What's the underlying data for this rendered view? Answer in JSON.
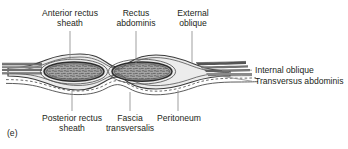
{
  "figure": {
    "panel_id": "(e)",
    "type": "anatomical-cross-section",
    "background": "#ffffff",
    "ink": "#231f20"
  },
  "labels": {
    "top": [
      {
        "id": "anterior-rectus-sheath",
        "line1": "Anterior rectus",
        "line2": "sheath"
      },
      {
        "id": "rectus-abdominis",
        "line1": "Rectus",
        "line2": "abdominis"
      },
      {
        "id": "external-oblique",
        "line1": "External",
        "line2": "oblique"
      }
    ],
    "right": [
      {
        "id": "internal-oblique",
        "line1": "Internal oblique"
      },
      {
        "id": "transversus-abdominis",
        "line1": "Transversus abdominis"
      }
    ],
    "bottom": [
      {
        "id": "posterior-rectus-sheath",
        "line1": "Posterior rectus",
        "line2": "sheath"
      },
      {
        "id": "fascia-transversalis",
        "line1": "Fascia",
        "line2": "transversalis"
      },
      {
        "id": "peritoneum",
        "line1": "Peritoneum",
        "line2": ""
      }
    ]
  },
  "colors": {
    "outline": "#3b3b3b",
    "muscle_fill": "#9d9d9d",
    "sheath_fill": "#e4e4e4",
    "band_dark": "#6f6f6f",
    "band_mid": "#8d8d8d",
    "leader": "#8a8a8a",
    "stipple": "#4a4a4a"
  }
}
